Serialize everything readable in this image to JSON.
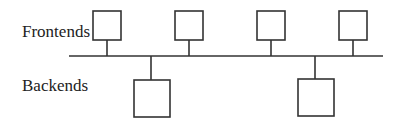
{
  "diagram": {
    "type": "bus-topology",
    "labels": {
      "frontends": "Frontends",
      "backends": "Backends"
    },
    "bus": {
      "name": "shared-bus"
    },
    "frontends": [
      {
        "id": "frontend-1"
      },
      {
        "id": "frontend-2"
      },
      {
        "id": "frontend-3"
      },
      {
        "id": "frontend-4"
      }
    ],
    "backends": [
      {
        "id": "backend-1"
      },
      {
        "id": "backend-2"
      }
    ],
    "colors": {
      "stroke": "#333333",
      "text": "#222222",
      "background": "#ffffff"
    }
  }
}
